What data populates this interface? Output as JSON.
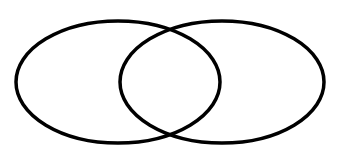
{
  "diagram": {
    "type": "venn",
    "background": "#ffffff",
    "stroke_color": "#000000",
    "stroke_width": 3.5,
    "sets": [
      {
        "id": "left-set",
        "cx": 118,
        "cy": 82,
        "rx": 102,
        "ry": 61,
        "label": ""
      },
      {
        "id": "right-set",
        "cx": 222,
        "cy": 82,
        "rx": 102,
        "ry": 61,
        "label": ""
      }
    ]
  }
}
